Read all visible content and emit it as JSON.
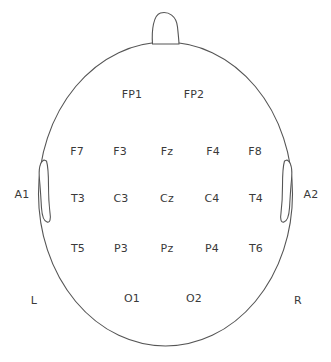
{
  "diagram": {
    "view": "top-down head map, nose at top",
    "colors": {
      "outline": "#555555",
      "text": "#3a3a3a",
      "background": "#ffffff"
    }
  },
  "head": {
    "outline_name": "head-outline",
    "nose_name": "nose-outline",
    "left_ear_name": "left-ear-outline",
    "right_ear_name": "right-ear-outline"
  },
  "electrodes": [
    {
      "label": "FP1",
      "x": 132,
      "y": 94,
      "row": "prefrontal",
      "side": "left"
    },
    {
      "label": "FP2",
      "x": 194,
      "y": 94,
      "row": "prefrontal",
      "side": "right"
    },
    {
      "label": "F7",
      "x": 77,
      "y": 151,
      "row": "frontal",
      "side": "left"
    },
    {
      "label": "F3",
      "x": 120,
      "y": 151,
      "row": "frontal",
      "side": "left"
    },
    {
      "label": "Fz",
      "x": 167,
      "y": 151,
      "row": "frontal",
      "side": "midline"
    },
    {
      "label": "F4",
      "x": 213,
      "y": 151,
      "row": "frontal",
      "side": "right"
    },
    {
      "label": "F8",
      "x": 255,
      "y": 151,
      "row": "frontal",
      "side": "right"
    },
    {
      "label": "T3",
      "x": 78,
      "y": 198,
      "row": "central",
      "side": "left"
    },
    {
      "label": "C3",
      "x": 121,
      "y": 198,
      "row": "central",
      "side": "left"
    },
    {
      "label": "Cz",
      "x": 167,
      "y": 198,
      "row": "central",
      "side": "midline"
    },
    {
      "label": "C4",
      "x": 212,
      "y": 198,
      "row": "central",
      "side": "right"
    },
    {
      "label": "T4",
      "x": 256,
      "y": 198,
      "row": "central",
      "side": "right"
    },
    {
      "label": "T5",
      "x": 78,
      "y": 248,
      "row": "parietal",
      "side": "left"
    },
    {
      "label": "P3",
      "x": 121,
      "y": 248,
      "row": "parietal",
      "side": "left"
    },
    {
      "label": "Pz",
      "x": 167,
      "y": 248,
      "row": "parietal",
      "side": "midline"
    },
    {
      "label": "P4",
      "x": 212,
      "y": 248,
      "row": "parietal",
      "side": "right"
    },
    {
      "label": "T6",
      "x": 256,
      "y": 248,
      "row": "parietal",
      "side": "right"
    },
    {
      "label": "O1",
      "x": 132,
      "y": 298,
      "row": "occipital",
      "side": "left"
    },
    {
      "label": "O2",
      "x": 194,
      "y": 298,
      "row": "occipital",
      "side": "right"
    }
  ],
  "references": [
    {
      "label": "A1",
      "x": 22,
      "y": 194,
      "name": "reference-a1"
    },
    {
      "label": "A2",
      "x": 311,
      "y": 194,
      "name": "reference-a2"
    }
  ],
  "orientation": [
    {
      "label": "L",
      "x": 34,
      "y": 300,
      "name": "orientation-left"
    },
    {
      "label": "R",
      "x": 298,
      "y": 300,
      "name": "orientation-right"
    }
  ]
}
